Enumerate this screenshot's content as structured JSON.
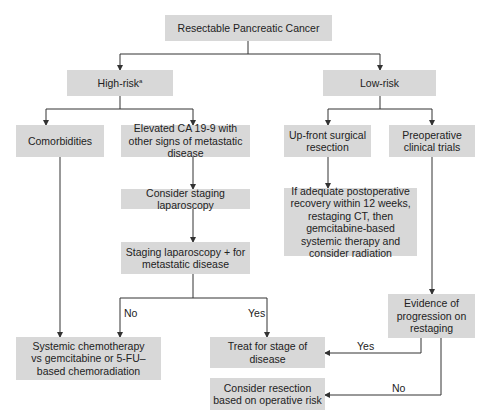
{
  "title": "Resectable Pancreatic Cancer",
  "nodes": {
    "root": "Resectable Pancreatic Cancer",
    "high_risk": "High-risk",
    "high_risk_sup": "a",
    "low_risk": "Low-risk",
    "comorbidities": "Comorbidities",
    "elevated_ca": "Elevated CA 19-9 with other signs of metastatic disease",
    "upfront_surgery": "Up-front surgical resection",
    "preop_trials": "Preoperative clinical trials",
    "consider_staging": "Consider staging laparoscopy",
    "staging_positive": "Staging laparoscopy + for metastatic disease",
    "if_adequate": "If adequate postoperative recovery within 12 weeks, restaging CT, then gemcitabine-based systemic therapy and consider radiation",
    "evidence_progression": "Evidence of progression on restaging",
    "systemic_chemo": "Systemic chemotherapy vs gemcitabine or 5-FU–based chemoradiation",
    "treat_stage": "Treat for stage of disease",
    "consider_resection": "Consider resection based on operative risk"
  },
  "edge_labels": {
    "staging_no": "No",
    "staging_yes": "Yes",
    "progression_yes": "Yes",
    "progression_no": "No"
  },
  "colors": {
    "box_fill": "#d8d8d8",
    "line": "#333333"
  }
}
